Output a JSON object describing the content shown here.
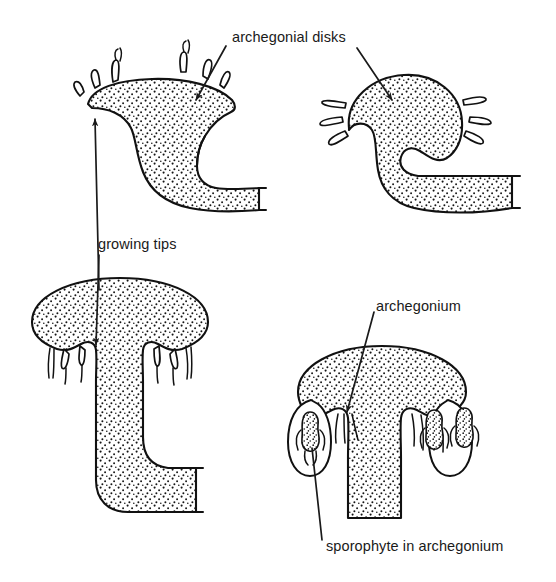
{
  "figure": {
    "background_color": "#ffffff",
    "ink_color": "#1a1a1a",
    "stipple_color": "#111111"
  },
  "labels": {
    "archegonial_disks": "archegonial disks",
    "growing_tips": "growing tips",
    "archegonium": "archegonium",
    "sporophyte_in_archegonium": "sporophyte in archegonium"
  },
  "panels": {
    "top_left": {
      "name": "early archegoniophore with archegonial disk",
      "rhizoid_count": 6
    },
    "top_right": {
      "name": "archegoniophore with rounded archegonial disk",
      "rhizoid_count": 5
    },
    "bottom_left": {
      "name": "elongated archegoniophore stalk with growing tip",
      "rhizoid_count": 6
    },
    "bottom_right": {
      "name": "mature archegoniophore bearing sporophytes",
      "sporophyte_count": 3
    }
  }
}
